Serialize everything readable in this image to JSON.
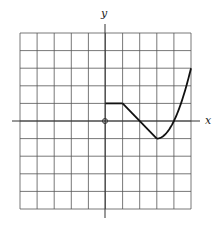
{
  "chart_data": {
    "type": "line",
    "title": "",
    "xlabel": "x",
    "ylabel": "y",
    "xlim": [
      -5,
      5
    ],
    "ylim": [
      -5,
      5
    ],
    "grid": true,
    "grid_step": 1,
    "origin_marker": "open-circle",
    "series": [
      {
        "name": "f(x)",
        "segments": [
          {
            "kind": "line",
            "points": [
              [
                0,
                1
              ],
              [
                1,
                1
              ]
            ]
          },
          {
            "kind": "line",
            "points": [
              [
                1,
                1
              ],
              [
                3,
                -1
              ]
            ]
          },
          {
            "kind": "curve",
            "points": [
              [
                3,
                -1
              ],
              [
                3.5,
                -0.75
              ],
              [
                4,
                0
              ],
              [
                4.5,
                1.25
              ],
              [
                5,
                3
              ]
            ]
          }
        ]
      }
    ]
  },
  "labels": {
    "x_axis": "x",
    "y_axis": "y"
  },
  "colors": {
    "grid": "#555555",
    "axis": "#333333",
    "curve": "#111111"
  }
}
